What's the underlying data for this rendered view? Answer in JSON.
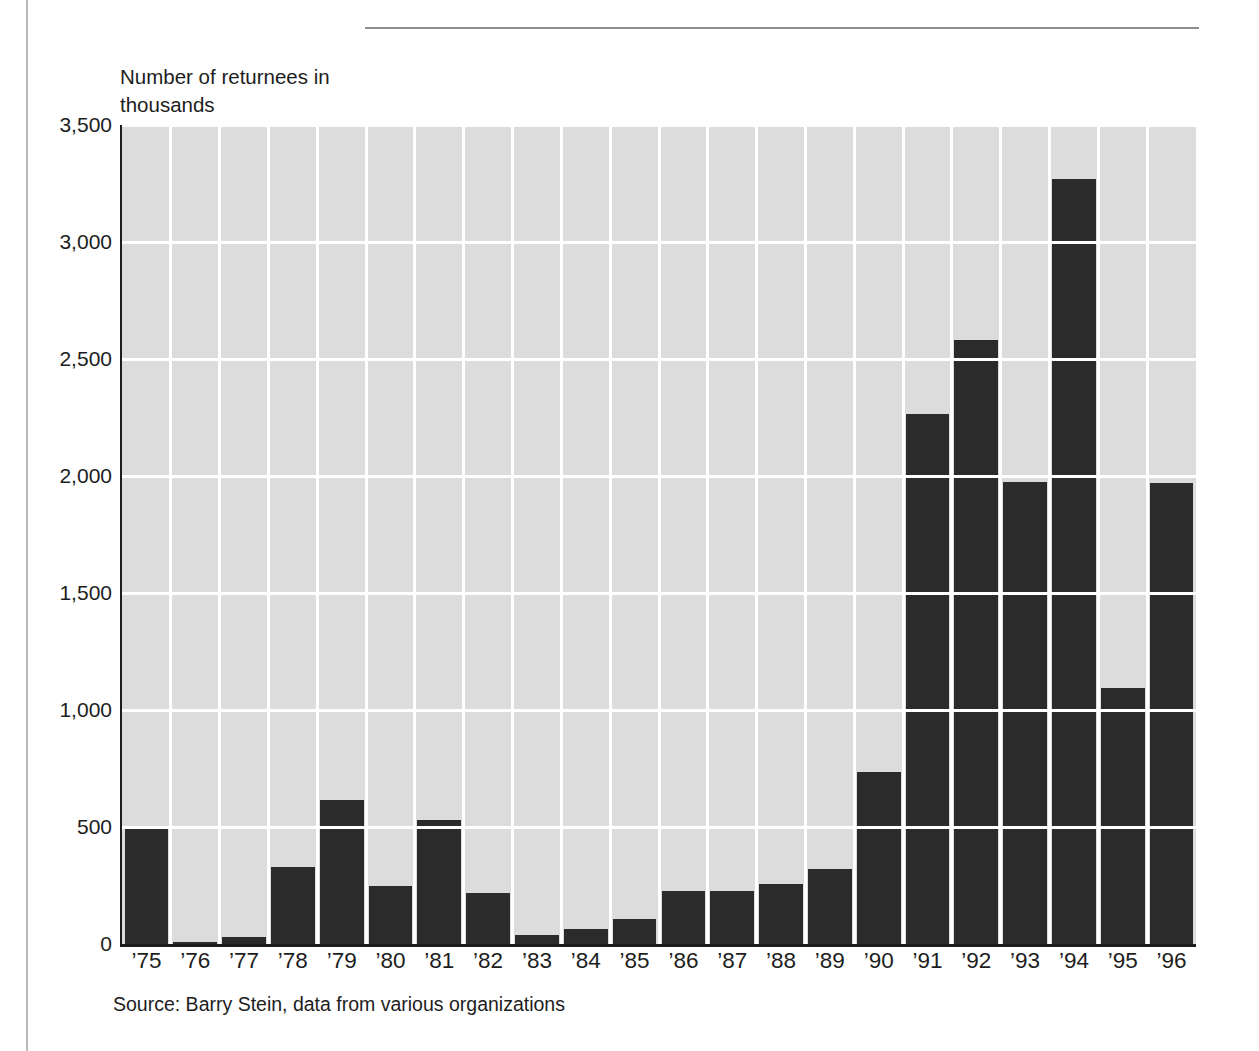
{
  "chart_data": {
    "type": "bar",
    "title": "",
    "subtitle": "",
    "xlabel": "",
    "ylabel": "Number of returnees in\nthousands",
    "ylim": [
      0,
      3500
    ],
    "ytick_values": [
      0,
      500,
      1000,
      1500,
      2000,
      2500,
      3000,
      3500
    ],
    "ytick_labels": [
      "0",
      "500",
      "1,000",
      "1,500",
      "2,000",
      "2,500",
      "3,000",
      "3,500"
    ],
    "grid": "horizontal-and-vertical",
    "legend": "none",
    "categories": [
      "’75",
      "’76",
      "’77",
      "’78",
      "’79",
      "’80",
      "’81",
      "’82",
      "’83",
      "’84",
      "’85",
      "’86",
      "’87",
      "’88",
      "’89",
      "’90",
      "’91",
      "’92",
      "’93",
      "’94",
      "’95",
      "’96"
    ],
    "values": [
      500,
      10,
      30,
      330,
      615,
      250,
      530,
      220,
      40,
      65,
      105,
      225,
      225,
      255,
      320,
      735,
      2265,
      2580,
      1975,
      3270,
      1095,
      1970
    ],
    "bar_color": "#2b2b2b",
    "plot_background": "#dcdcdc",
    "gridline_color": "#ffffff",
    "annotations": []
  },
  "figure": {
    "source_note": "Source: Barry Stein, data from various organizations"
  }
}
